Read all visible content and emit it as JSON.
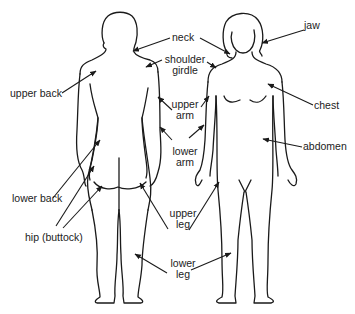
{
  "diagram": {
    "figures": [
      {
        "name": "back-view-figure",
        "view": "back"
      },
      {
        "name": "front-view-figure",
        "view": "front"
      }
    ],
    "labels": {
      "neck": "neck",
      "jaw": "jaw",
      "shoulder_girdle_1": "shoulder",
      "shoulder_girdle_2": "girdle",
      "upper_back": "upper back",
      "chest": "chest",
      "upper_arm_1": "upper",
      "upper_arm_2": "arm",
      "lower_arm_1": "lower",
      "lower_arm_2": "arm",
      "abdomen": "abdomen",
      "lower_back": "lower back",
      "hip": "hip (buttock)",
      "upper_leg_1": "upper",
      "upper_leg_2": "leg",
      "lower_leg_1": "lower",
      "lower_leg_2": "leg"
    },
    "colors": {
      "line": "#1a1a1a",
      "text": "#222222",
      "background": "#ffffff"
    }
  }
}
